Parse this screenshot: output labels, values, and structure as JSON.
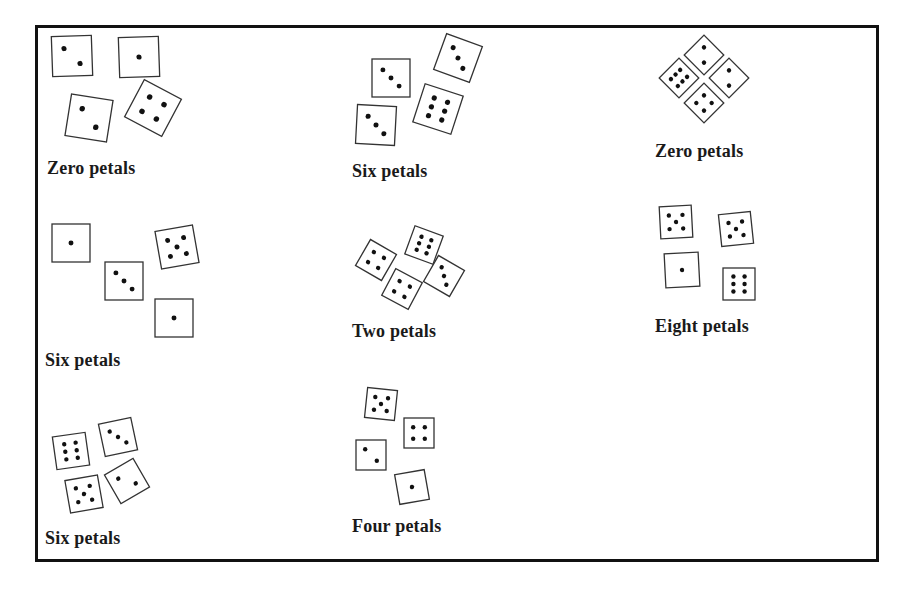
{
  "figure": {
    "frame_color": "#111111",
    "die_stroke": "#333333",
    "pip_color": "#111111",
    "groups": [
      {
        "id": "g1",
        "label": "Zero petals",
        "label_pos": [
          47,
          160
        ],
        "dice": [
          {
            "cx": 72,
            "cy": 56,
            "size": 40,
            "rot": -2,
            "value": 2
          },
          {
            "cx": 139,
            "cy": 57,
            "size": 40,
            "rot": -2,
            "value": 1
          },
          {
            "cx": 89,
            "cy": 118,
            "size": 42,
            "rot": 9,
            "value": 2
          },
          {
            "cx": 153,
            "cy": 108,
            "size": 42,
            "rot": 28,
            "value": 4
          }
        ]
      },
      {
        "id": "g2",
        "label": "Six petals",
        "label_pos": [
          352,
          163
        ],
        "dice": [
          {
            "cx": 391,
            "cy": 78,
            "size": 38,
            "rot": 0,
            "value": 3
          },
          {
            "cx": 458,
            "cy": 58,
            "size": 38,
            "rot": 20,
            "value": 3
          },
          {
            "cx": 376,
            "cy": 125,
            "size": 39,
            "rot": 3,
            "value": 3
          },
          {
            "cx": 438,
            "cy": 109,
            "size": 40,
            "rot": 18,
            "value": 6
          }
        ]
      },
      {
        "id": "g3",
        "label": "Zero petals",
        "label_pos": [
          655,
          143
        ],
        "dice": [
          {
            "cx": 704,
            "cy": 55,
            "size": 28,
            "rot": 45,
            "value": 2
          },
          {
            "cx": 679,
            "cy": 78,
            "size": 28,
            "rot": 45,
            "value": 6
          },
          {
            "cx": 729,
            "cy": 78,
            "size": 28,
            "rot": 45,
            "value": 2
          },
          {
            "cx": 704,
            "cy": 103,
            "size": 28,
            "rot": 45,
            "value": 4
          }
        ]
      },
      {
        "id": "g4",
        "label": "Six petals",
        "label_pos": [
          45,
          352
        ],
        "dice": [
          {
            "cx": 71,
            "cy": 243,
            "size": 38,
            "rot": 0,
            "value": 1
          },
          {
            "cx": 124,
            "cy": 281,
            "size": 38,
            "rot": 0,
            "value": 3
          },
          {
            "cx": 177,
            "cy": 247,
            "size": 38,
            "rot": -10,
            "value": 5
          },
          {
            "cx": 174,
            "cy": 318,
            "size": 38,
            "rot": 0,
            "value": 1
          }
        ]
      },
      {
        "id": "g5",
        "label": "Two petals",
        "label_pos": [
          352,
          323
        ],
        "dice": [
          {
            "cx": 376,
            "cy": 260,
            "size": 30,
            "rot": 30,
            "value": 4
          },
          {
            "cx": 424,
            "cy": 245,
            "size": 30,
            "rot": 20,
            "value": 6
          },
          {
            "cx": 402,
            "cy": 289,
            "size": 30,
            "rot": 28,
            "value": 4
          },
          {
            "cx": 444,
            "cy": 276,
            "size": 30,
            "rot": 30,
            "value": 3
          }
        ]
      },
      {
        "id": "g6",
        "label": "Eight petals",
        "label_pos": [
          655,
          318
        ],
        "dice": [
          {
            "cx": 676,
            "cy": 222,
            "size": 32,
            "rot": -3,
            "value": 5
          },
          {
            "cx": 736,
            "cy": 229,
            "size": 32,
            "rot": -6,
            "value": 5
          },
          {
            "cx": 682,
            "cy": 270,
            "size": 34,
            "rot": -3,
            "value": 1
          },
          {
            "cx": 739,
            "cy": 284,
            "size": 32,
            "rot": 0,
            "value": 6
          }
        ]
      },
      {
        "id": "g7",
        "label": "Six petals",
        "label_pos": [
          45,
          530
        ],
        "dice": [
          {
            "cx": 71,
            "cy": 451,
            "size": 33,
            "rot": -8,
            "value": 6
          },
          {
            "cx": 118,
            "cy": 437,
            "size": 33,
            "rot": -12,
            "value": 3
          },
          {
            "cx": 84,
            "cy": 494,
            "size": 33,
            "rot": -10,
            "value": 5
          },
          {
            "cx": 127,
            "cy": 481,
            "size": 33,
            "rot": -30,
            "value": 2
          }
        ]
      },
      {
        "id": "g8",
        "label": "Four petals",
        "label_pos": [
          352,
          518
        ],
        "dice": [
          {
            "cx": 381,
            "cy": 404,
            "size": 30,
            "rot": 6,
            "value": 5
          },
          {
            "cx": 419,
            "cy": 433,
            "size": 30,
            "rot": 0,
            "value": 4
          },
          {
            "cx": 371,
            "cy": 455,
            "size": 30,
            "rot": 0,
            "value": 2
          },
          {
            "cx": 412,
            "cy": 487,
            "size": 30,
            "rot": -10,
            "value": 1
          }
        ]
      }
    ]
  }
}
